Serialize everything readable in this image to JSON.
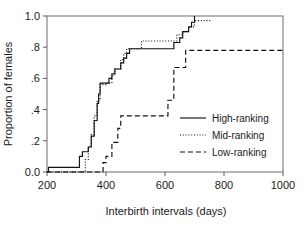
{
  "chart_data": {
    "type": "line",
    "title": "",
    "xlabel": "Interbirth intervals (days)",
    "ylabel": "Proportion of females",
    "xlim": [
      200,
      1000
    ],
    "ylim": [
      0.0,
      1.0
    ],
    "xticks": [
      200,
      400,
      600,
      800,
      1000
    ],
    "xticklabels": [
      "200",
      "400",
      "600",
      "800",
      "1000"
    ],
    "yticks": [
      0.0,
      0.2,
      0.4,
      0.6,
      0.8,
      1.0
    ],
    "yticklabels": [
      "0.0",
      ".2",
      ".4",
      ".6",
      ".8",
      "1.0"
    ],
    "grid": false,
    "legend_position": "lower right",
    "interpolation": "step-post",
    "series": [
      {
        "name": "High-ranking",
        "style": "solid",
        "color": "#111111",
        "x": [
          200,
          205,
          215,
          300,
          310,
          320,
          330,
          340,
          350,
          360,
          370,
          375,
          380,
          400,
          410,
          420,
          430,
          440,
          450,
          460,
          470,
          480,
          620,
          630,
          650,
          660,
          680,
          690,
          700
        ],
        "y": [
          0.0,
          0.03,
          0.03,
          0.03,
          0.1,
          0.13,
          0.13,
          0.16,
          0.23,
          0.33,
          0.44,
          0.5,
          0.57,
          0.57,
          0.6,
          0.63,
          0.66,
          0.66,
          0.7,
          0.73,
          0.76,
          0.79,
          0.79,
          0.83,
          0.86,
          0.9,
          0.93,
          0.96,
          1.0
        ]
      },
      {
        "name": "Mid-ranking",
        "style": "dotted",
        "color": "#111111",
        "x": [
          200,
          320,
          330,
          340,
          350,
          360,
          370,
          380,
          400,
          420,
          430,
          440,
          450,
          460,
          470,
          520,
          620,
          640,
          660,
          680,
          700,
          710,
          730,
          760
        ],
        "y": [
          0.0,
          0.0,
          0.08,
          0.16,
          0.24,
          0.36,
          0.46,
          0.56,
          0.57,
          0.62,
          0.66,
          0.66,
          0.72,
          0.76,
          0.79,
          0.84,
          0.84,
          0.88,
          0.9,
          0.93,
          0.97,
          0.97,
          0.97,
          0.97
        ]
      },
      {
        "name": "Low-ranking",
        "style": "dashed",
        "color": "#111111",
        "x": [
          200,
          380,
          390,
          400,
          410,
          420,
          430,
          440,
          450,
          600,
          610,
          620,
          630,
          660,
          670,
          1000
        ],
        "y": [
          0.0,
          0.0,
          0.06,
          0.1,
          0.1,
          0.19,
          0.19,
          0.28,
          0.36,
          0.36,
          0.46,
          0.46,
          0.67,
          0.67,
          0.78,
          0.78
        ]
      }
    ]
  },
  "legend": {
    "entries": [
      {
        "label": "High-ranking",
        "style": "solid"
      },
      {
        "label": "Mid-ranking",
        "style": "dotted"
      },
      {
        "label": "Low-ranking",
        "style": "dashed"
      }
    ]
  },
  "colors": {
    "line": "#111111",
    "frame": "#7a7a7a",
    "text": "#1a1a1a",
    "background": "#ffffff"
  }
}
